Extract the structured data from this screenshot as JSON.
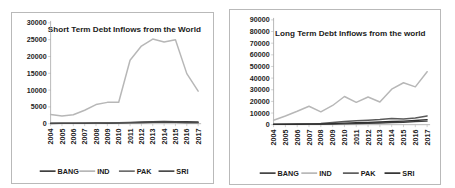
{
  "page": {
    "background_color": "#ffffff",
    "border_color": "#b9b9b9"
  },
  "chart_data": [
    {
      "id": "short-term",
      "type": "line",
      "title": "Short Term Debt Inflows from the World",
      "xlabel": "",
      "ylabel": "",
      "ylim": [
        0,
        30000
      ],
      "ytick_step": 5000,
      "yticks": [
        "0",
        "5000",
        "10000",
        "15000",
        "20000",
        "25000",
        "30000"
      ],
      "grid": false,
      "legend_position": "bottom",
      "categories": [
        "2004",
        "2005",
        "2006",
        "2007",
        "2008",
        "2009",
        "2010",
        "2011",
        "2012",
        "2013",
        "2014",
        "2015",
        "2016",
        "2017"
      ],
      "series": [
        {
          "name": "BANG",
          "color": "#3f3f3f",
          "width": 1.3,
          "values": [
            120,
            130,
            150,
            190,
            230,
            260,
            330,
            420,
            520,
            620,
            700,
            640,
            580,
            560
          ]
        },
        {
          "name": "IND",
          "color": "#b7b7b7",
          "width": 1.5,
          "values": [
            2750,
            2300,
            2650,
            4000,
            5700,
            6350,
            6400,
            18900,
            23100,
            25200,
            24300,
            25000,
            14900,
            8800
          ]
        },
        {
          "name": "PAK",
          "color": "#6d6d6d",
          "width": 1.3,
          "values": [
            180,
            180,
            200,
            220,
            250,
            230,
            260,
            300,
            350,
            400,
            420,
            380,
            330,
            300
          ]
        },
        {
          "name": "SRI",
          "color": "#4a4a4a",
          "width": 1.3,
          "values": [
            60,
            70,
            80,
            110,
            140,
            130,
            180,
            240,
            310,
            380,
            430,
            390,
            330,
            300
          ]
        }
      ],
      "last_point_override": {
        "IND": 9700
      }
    },
    {
      "id": "long-term",
      "type": "line",
      "title": "Long Term Debt Inflows from the world",
      "xlabel": "",
      "ylabel": "",
      "ylim": [
        0,
        90000
      ],
      "ytick_step": 10000,
      "yticks": [
        "0",
        "10000",
        "20000",
        "30000",
        "40000",
        "50000",
        "60000",
        "70000",
        "80000",
        "90000"
      ],
      "grid": false,
      "legend_position": "bottom",
      "categories": [
        "2004",
        "2005",
        "2006",
        "2007",
        "2008",
        "2009",
        "2010",
        "2011",
        "2012",
        "2013",
        "2014",
        "2015",
        "2016",
        "2017"
      ],
      "series": [
        {
          "name": "BANG",
          "color": "#3f3f3f",
          "width": 1.3,
          "values": [
            300,
            330,
            380,
            420,
            480,
            560,
            700,
            900,
            1150,
            1450,
            1800,
            2100,
            2600,
            3100
          ]
        },
        {
          "name": "IND",
          "color": "#b7b7b7",
          "width": 1.5,
          "values": [
            3800,
            7500,
            11500,
            15800,
            11000,
            16500,
            24200,
            19200,
            23800,
            19500,
            30500,
            36000,
            32500,
            45500
          ]
        },
        {
          "name": "PAK",
          "color": "#5a5a5a",
          "width": 1.5,
          "values": [
            400,
            500,
            650,
            800,
            1100,
            1900,
            2700,
            3300,
            3900,
            4400,
            5400,
            4900,
            5800,
            7500
          ]
        },
        {
          "name": "SRI",
          "color": "#2f2f2f",
          "width": 1.4,
          "values": [
            250,
            300,
            380,
            450,
            600,
            900,
            1300,
            1650,
            2000,
            2300,
            2700,
            3100,
            3600,
            4300
          ]
        }
      ],
      "scale_note": "IND values shown at chart scale; 2017 peak reaches 77000"
    }
  ],
  "legend": {
    "entries": [
      "BANG",
      "IND",
      "PAK",
      "SRI"
    ]
  }
}
